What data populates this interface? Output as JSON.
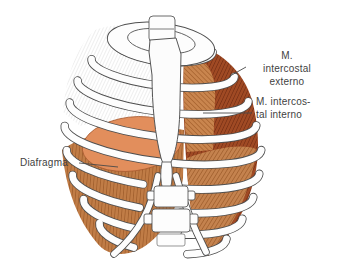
{
  "figure": {
    "labels": {
      "externo": "M.\nintercostal\nexterno",
      "interno": "M. intercos-\ntal interno",
      "diafragma": "Diafragma"
    },
    "colors": {
      "background": "#ffffff",
      "outline": "#4f4f4f",
      "rib_fill": "#fdfdfd",
      "external_intercostal": "#a04a24",
      "external_fiber": "#6b2810",
      "internal_intercostal": "#c4824e",
      "internal_fiber": "#8f4e1e",
      "diaphragm": "#e28e5c",
      "diaphragm_outline": "#a85a30",
      "label_text": "#3f3f3f"
    }
  }
}
